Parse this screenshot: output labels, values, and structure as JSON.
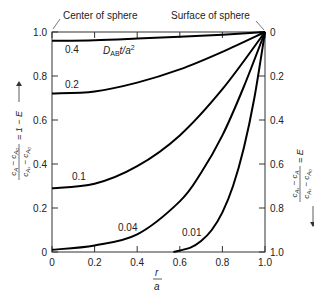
{
  "chart_data": {
    "type": "line",
    "title": "",
    "xlabel": "r/a",
    "ylabel_left": "(c_A - c_A0)/(c_As - c_A0) = 1 - E",
    "ylabel_right": "(c_As - c_A)/(c_As - c_A0) = E",
    "xlim": [
      0,
      1.0
    ],
    "ylim_left": [
      0,
      1.0
    ],
    "ylim_right": [
      1.0,
      0
    ],
    "x_ticks": [
      "0",
      "0.2",
      "0.4",
      "0.6",
      "0.8",
      "1.0"
    ],
    "y_ticks_left": [
      "0",
      "0.2",
      "0.4",
      "0.6",
      "0.8",
      "1.0"
    ],
    "y_ticks_right": [
      "1.0",
      "0.8",
      "0.6",
      "0.4",
      "0.2",
      "0"
    ],
    "grid": false,
    "legend": null,
    "parameter_label": "D_AB t/a^2",
    "annotations": [
      {
        "text": "Center of sphere",
        "points_to": [
          0,
          1.0
        ]
      },
      {
        "text": "Surface of sphere",
        "points_to": [
          1.0,
          1.0
        ]
      }
    ],
    "series": [
      {
        "name": "0.4",
        "x": [
          0,
          0.2,
          0.4,
          0.6,
          0.8,
          1.0
        ],
        "y": [
          0.96,
          0.963,
          0.97,
          0.978,
          0.988,
          1.0
        ]
      },
      {
        "name": "0.2",
        "x": [
          0,
          0.2,
          0.4,
          0.6,
          0.8,
          1.0
        ],
        "y": [
          0.72,
          0.73,
          0.77,
          0.83,
          0.91,
          1.0
        ]
      },
      {
        "name": "0.1",
        "x": [
          0,
          0.2,
          0.4,
          0.6,
          0.8,
          1.0
        ],
        "y": [
          0.29,
          0.31,
          0.39,
          0.53,
          0.74,
          1.0
        ]
      },
      {
        "name": "0.04",
        "x": [
          0,
          0.2,
          0.4,
          0.6,
          0.7,
          0.8,
          0.9,
          1.0
        ],
        "y": [
          0.01,
          0.03,
          0.08,
          0.23,
          0.36,
          0.53,
          0.75,
          1.0
        ]
      },
      {
        "name": "0.01",
        "x": [
          0.57,
          0.65,
          0.7,
          0.75,
          0.8,
          0.85,
          0.9,
          0.95,
          1.0
        ],
        "y": [
          0.0,
          0.02,
          0.05,
          0.1,
          0.18,
          0.3,
          0.47,
          0.7,
          1.0
        ]
      }
    ]
  },
  "labels": {
    "center": "Center of sphere",
    "surface": "Surface of sphere",
    "param": "D",
    "param_sub": "AB",
    "param_rest": "t/a",
    "param_sup": "2",
    "x_num": "r",
    "x_den": "a",
    "left_axis": "c_A − c_A0 / c_As − c_A0 = 1 − E",
    "right_axis": "c_As − c_A / c_As − c_A0 = E",
    "curve_labels": [
      "0.4",
      "0.2",
      "0.1",
      "0.04",
      "0.01"
    ]
  }
}
